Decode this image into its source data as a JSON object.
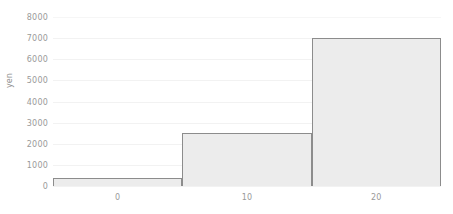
{
  "chart_data": {
    "type": "bar",
    "title": "",
    "subtitle": "",
    "xlabel": "",
    "ylabel": "yen",
    "xlim": [
      -5,
      25
    ],
    "ylim": [
      0,
      8000
    ],
    "grid": true,
    "legend": false,
    "legend_position": "none",
    "categories": [
      "-5 to 5",
      "5 to 15",
      "15 to 25"
    ],
    "values": [
      400,
      2500,
      7000
    ],
    "bars": [
      {
        "label": "-5 to 5",
        "x_start": -5,
        "x_end": 5,
        "value": 400
      },
      {
        "label": "5 to 15",
        "x_start": 5,
        "x_end": 15,
        "value": 2500
      },
      {
        "label": "15 to 25",
        "x_start": 15,
        "x_end": 25,
        "value": 7000
      }
    ],
    "yticks": [
      0,
      1000,
      2000,
      3000,
      4000,
      5000,
      6000,
      7000,
      8000
    ],
    "ytick_labels": [
      "0",
      "1000",
      "2000",
      "3000",
      "4000",
      "5000",
      "6000",
      "7000",
      "8000"
    ],
    "xticks": [
      0,
      10,
      20
    ],
    "xtick_labels": [
      "0",
      "10",
      "20"
    ],
    "colors": {
      "bar_fill": "#ececec",
      "bar_edge": "#8c8c8c",
      "grid": "#f2f2f2",
      "tick_text": "#9a9a9a",
      "axis_label": "#8e8e8e",
      "background": "#ffffff"
    }
  }
}
